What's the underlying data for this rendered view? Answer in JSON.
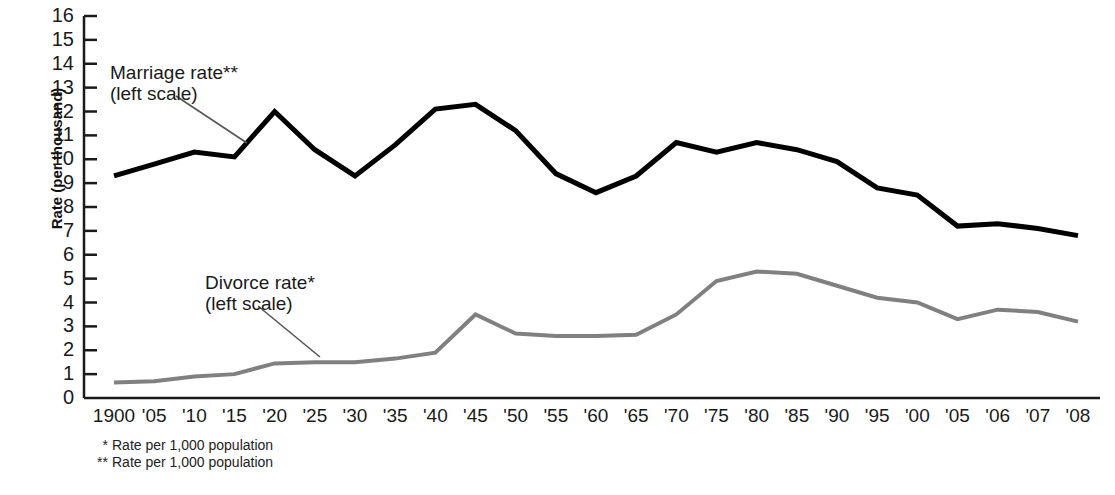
{
  "chart_data": {
    "type": "line",
    "title": "",
    "subtitle": "",
    "xlabel": "",
    "ylabel": "Rate (per thousand)",
    "ylim": [
      0,
      16
    ],
    "yticks": [
      0,
      1,
      2,
      3,
      4,
      5,
      6,
      7,
      8,
      9,
      10,
      11,
      12,
      13,
      14,
      15,
      16
    ],
    "grid": false,
    "legend_position": "inline-annotations",
    "categories": [
      "1900",
      "'05",
      "'10",
      "'15",
      "'20",
      "'25",
      "'30",
      "'35",
      "'40",
      "'45",
      "'50",
      "'55",
      "'60",
      "'65",
      "'70",
      "'75",
      "'80",
      "'85",
      "'90",
      "'95",
      "'00",
      "'05",
      "'06",
      "'07",
      "'08"
    ],
    "series": [
      {
        "name": "Marriage rate",
        "color": "#000000",
        "width": 5,
        "values": [
          9.3,
          9.8,
          10.3,
          10.1,
          12.0,
          10.4,
          9.3,
          10.6,
          12.1,
          12.3,
          11.2,
          9.4,
          8.6,
          9.3,
          10.7,
          10.3,
          10.7,
          10.4,
          9.9,
          8.8,
          8.5,
          7.2,
          7.3,
          7.1,
          6.8
        ]
      },
      {
        "name": "Divorce rate",
        "color": "#808080",
        "width": 4,
        "values": [
          0.65,
          0.7,
          0.9,
          1.0,
          1.45,
          1.5,
          1.5,
          1.65,
          1.9,
          3.5,
          2.7,
          2.6,
          2.6,
          2.65,
          3.5,
          4.9,
          5.3,
          5.2,
          4.7,
          4.2,
          4.0,
          3.3,
          3.7,
          3.6,
          3.2
        ]
      }
    ],
    "annotations": [
      {
        "id": "marriage",
        "line1": "Marriage rate**",
        "line2": "(left scale)",
        "x": 110,
        "y": 62,
        "leader": {
          "x1": 176,
          "y1": 96,
          "x2": 247,
          "y2": 143
        }
      },
      {
        "id": "divorce",
        "line1": "Divorce rate*",
        "line2": "(left scale)",
        "x": 205,
        "y": 272,
        "leader": {
          "x1": 258,
          "y1": 306,
          "x2": 320,
          "y2": 357
        }
      }
    ],
    "footnotes": [
      {
        "mark": "*",
        "text": "Rate per 1,000 population"
      },
      {
        "mark": "**",
        "text": "Rate per 1,000 population"
      }
    ],
    "axis_color": "#1a1a1a"
  }
}
